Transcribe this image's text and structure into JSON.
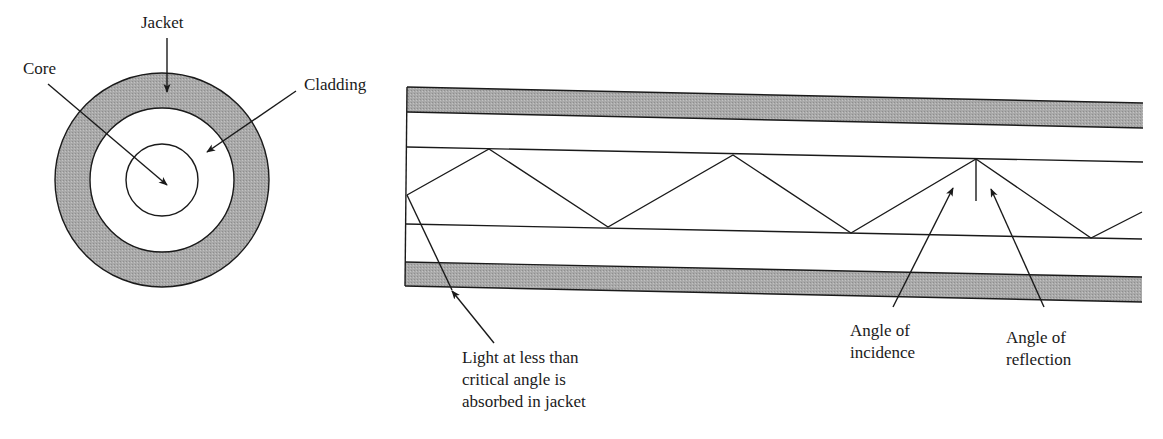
{
  "figure": {
    "type": "optical-fiber-diagram",
    "colors": {
      "jacket_fill": "#a8a8a8",
      "line": "#1a1a1a",
      "background": "#ffffff"
    }
  },
  "cross_section": {
    "labels": {
      "jacket": "Jacket",
      "core": "Core",
      "cladding": "Cladding"
    },
    "center": [
      162,
      180
    ],
    "radii": {
      "jacket_outer": 107,
      "cladding_outer": 72,
      "core": 36
    }
  },
  "longitudinal_view": {
    "labels": {
      "absorbed": [
        "Light at less than",
        "critical angle is",
        "absorbed in jacket"
      ],
      "incidence": [
        "Angle of",
        "incidence"
      ],
      "reflection": [
        "Angle of",
        "reflection"
      ]
    },
    "ray_path": [
      [
        407,
        195
      ],
      [
        489,
        149
      ],
      [
        608,
        227
      ],
      [
        733,
        155
      ],
      [
        851,
        233
      ],
      [
        976,
        159
      ],
      [
        1091,
        238
      ],
      [
        1142,
        212
      ]
    ]
  }
}
